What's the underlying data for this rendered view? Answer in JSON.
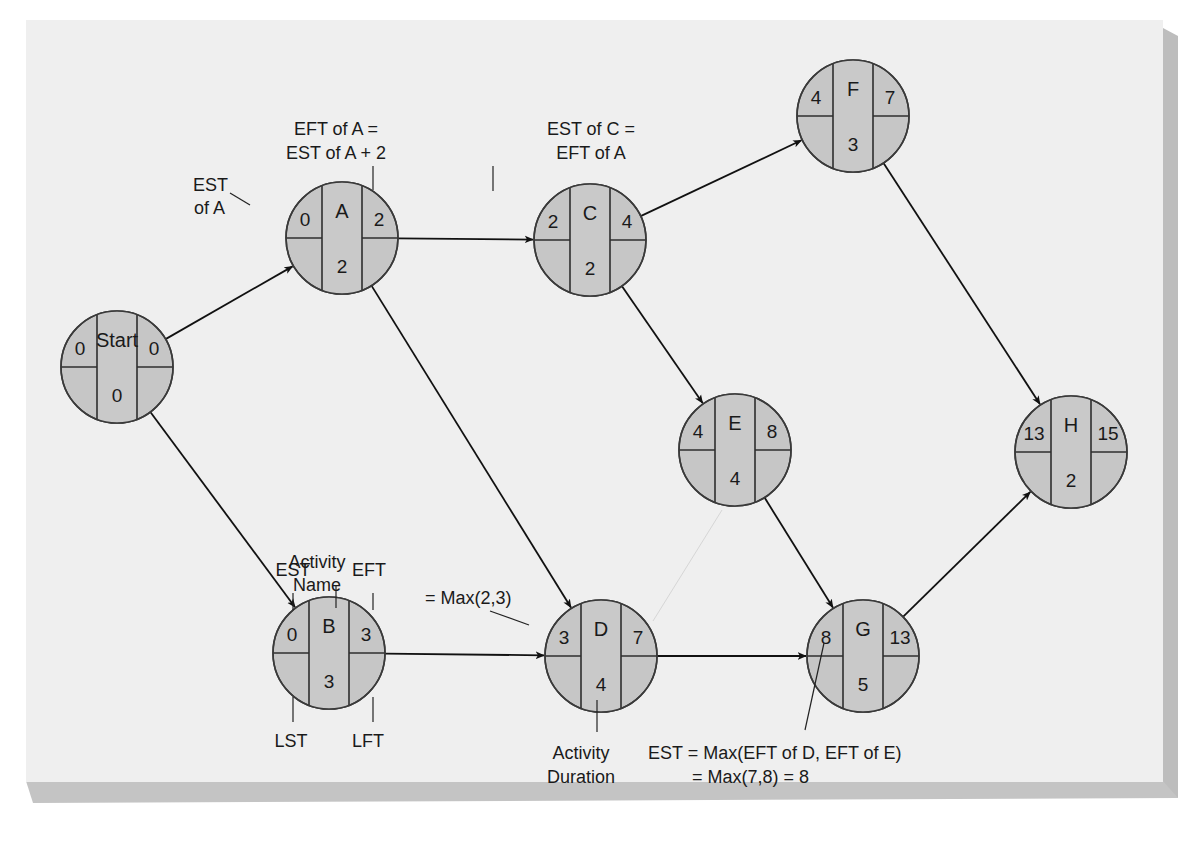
{
  "diagram": {
    "legend": {
      "activity_name": "Activity\nName",
      "est": "EST",
      "eft": "EFT",
      "lst": "LST",
      "lft": "LFT",
      "activity_duration": "Activity\nDuration"
    },
    "nodes": [
      {
        "id": "Start",
        "name": "Start",
        "est": "0",
        "eft": "0",
        "duration": "0",
        "cx": 117,
        "cy": 367
      },
      {
        "id": "A",
        "name": "A",
        "est": "0",
        "eft": "2",
        "duration": "2",
        "cx": 342,
        "cy": 238
      },
      {
        "id": "B",
        "name": "B",
        "est": "0",
        "eft": "3",
        "duration": "3",
        "cx": 329,
        "cy": 653
      },
      {
        "id": "C",
        "name": "C",
        "est": "2",
        "eft": "4",
        "duration": "2",
        "cx": 590,
        "cy": 240
      },
      {
        "id": "D",
        "name": "D",
        "est": "3",
        "eft": "7",
        "duration": "4",
        "cx": 601,
        "cy": 656
      },
      {
        "id": "E",
        "name": "E",
        "est": "4",
        "eft": "8",
        "duration": "4",
        "cx": 735,
        "cy": 450
      },
      {
        "id": "F",
        "name": "F",
        "est": "4",
        "eft": "7",
        "duration": "3",
        "cx": 853,
        "cy": 116
      },
      {
        "id": "G",
        "name": "G",
        "est": "8",
        "eft": "13",
        "duration": "5",
        "cx": 863,
        "cy": 656
      },
      {
        "id": "H",
        "name": "H",
        "est": "13",
        "eft": "15",
        "duration": "2",
        "cx": 1071,
        "cy": 452
      }
    ],
    "edges": [
      {
        "from": "Start",
        "to": "A"
      },
      {
        "from": "Start",
        "to": "B"
      },
      {
        "from": "A",
        "to": "C"
      },
      {
        "from": "A",
        "to": "D"
      },
      {
        "from": "B",
        "to": "D"
      },
      {
        "from": "C",
        "to": "F"
      },
      {
        "from": "C",
        "to": "E"
      },
      {
        "from": "D",
        "to": "G"
      },
      {
        "from": "E",
        "to": "G"
      },
      {
        "from": "F",
        "to": "H"
      },
      {
        "from": "G",
        "to": "H"
      }
    ],
    "annotations": {
      "est_of_a_line1": "EST",
      "est_of_a_line2": "of A",
      "eft_of_a_line1": "EFT of A =",
      "eft_of_a_line2": "EST of A + 2",
      "est_of_c_line1": "EST of C =",
      "est_of_c_line2": "EFT of A",
      "max_2_3": "= Max(2,3)",
      "est_g_line1": "EST = Max(EFT of D, EFT of E)",
      "est_g_line2": "= Max(7,8) = 8",
      "activity_name_line1": "Activity",
      "activity_name_line2": "Name",
      "activity_duration_line1": "Activity",
      "activity_duration_line2": "Duration"
    }
  }
}
